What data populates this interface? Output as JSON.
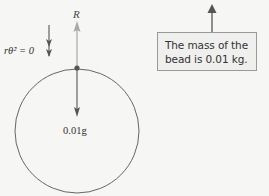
{
  "diagram": {
    "labels": {
      "reaction": "R",
      "centripetal_term": "rθ̇² = 0",
      "weight": "0.01g"
    },
    "callout": {
      "line1": "The mass of the",
      "line2": "bead is 0.01 kg."
    },
    "colors": {
      "background": "#f6f6f4",
      "line": "#555555",
      "reaction_arrow": "#a8a8a8",
      "callout_fill": "#efefed",
      "callout_border": "#9a9a9a"
    },
    "geometry": {
      "circle_center": [
        77,
        131
      ],
      "circle_radius": 62,
      "bead": [
        77,
        68
      ]
    }
  }
}
